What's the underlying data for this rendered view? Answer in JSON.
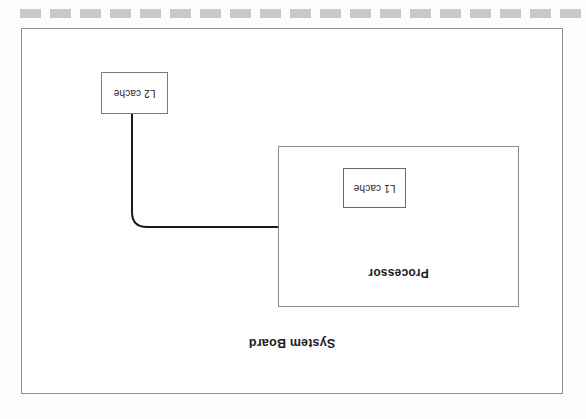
{
  "page": {
    "width": 586,
    "height": 419,
    "background_color": "#fdfdfd"
  },
  "scan_artifacts": {
    "top_strip": {
      "name": "dashed-perforation-strip",
      "dash_count": 19,
      "dash_width": 21,
      "dash_gap": 9,
      "dash_color": "#c9c9c9",
      "start_x": 20,
      "top": 9,
      "height": 9
    },
    "note": "Page content is rotated 180 degrees (scanned upside-down)"
  },
  "diagram": {
    "type": "block-diagram",
    "orientation_degrees": 180,
    "outer": {
      "label": "System Board",
      "border_color": "#8e8e94",
      "fill_color": "#ffffff"
    },
    "processor": {
      "label": "Processor",
      "border_color": "#8a8a90",
      "fill_color": "#ffffff"
    },
    "l1_cache": {
      "label": "L1 cache",
      "border_color": "#6a6a70",
      "fill_color": "#ffffff"
    },
    "l2_cache": {
      "label": "L2 cache",
      "border_color": "#7a7a80",
      "fill_color": "#ffffff"
    },
    "connector": {
      "name": "l2-to-processor-bus",
      "stroke_color": "#1a1a1a",
      "stroke_width": 2,
      "corner_radius": 15,
      "from": "L2 cache",
      "to": "Processor"
    }
  }
}
